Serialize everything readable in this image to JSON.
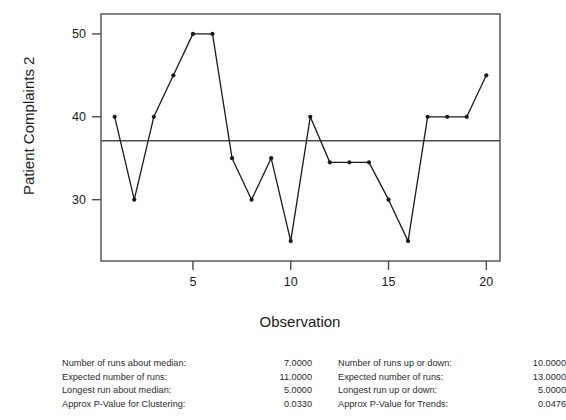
{
  "chart_data": {
    "type": "line",
    "title": "",
    "subtitle": "",
    "xlabel": "Observation",
    "ylabel": "Patient Complaints 2",
    "x": [
      1,
      2,
      3,
      4,
      5,
      6,
      7,
      8,
      9,
      10,
      11,
      12,
      13,
      14,
      15,
      16,
      17,
      18,
      19,
      20
    ],
    "values": [
      40,
      30,
      40,
      45,
      50,
      50,
      35,
      30,
      35,
      25,
      40,
      34.5,
      34.5,
      34.5,
      30,
      25,
      40,
      40,
      40,
      45
    ],
    "series": [
      {
        "name": "Patient Complaints 2",
        "values": [
          40,
          30,
          40,
          45,
          50,
          50,
          35,
          30,
          35,
          25,
          40,
          34.5,
          34.5,
          34.5,
          30,
          25,
          40,
          40,
          40,
          45
        ]
      }
    ],
    "reference_lines": [
      {
        "name": "median",
        "value": 37.1,
        "orientation": "horizontal"
      }
    ],
    "xlim": [
      0.3,
      20.7
    ],
    "ylim": [
      22.6,
      52.4
    ],
    "xticks": [
      5,
      10,
      15,
      20
    ],
    "xtick_labels": [
      "5",
      "10",
      "15",
      "20"
    ],
    "yticks": [
      30,
      40,
      50
    ],
    "ytick_labels": [
      "30",
      "40",
      "50"
    ],
    "grid": false,
    "legend": "none",
    "marker": "filled-circle",
    "line_color": "#1a1a1a",
    "median_line_color": "#4d4d4d",
    "frame_color": "#4d4d4d",
    "background_color": "#ffffff"
  },
  "stats": {
    "left": {
      "rows": [
        {
          "label": "Number of runs about median:",
          "value": "7.0000"
        },
        {
          "label": "Expected number of runs:",
          "value": "11.0000"
        },
        {
          "label": "Longest run about median:",
          "value": "5.0000"
        },
        {
          "label": "Approx P-Value for Clustering:",
          "value": "0.0330"
        }
      ]
    },
    "right": {
      "rows": [
        {
          "label": "Number of runs up or down:",
          "value": "10.0000"
        },
        {
          "label": "Expected number of runs:",
          "value": "13.0000"
        },
        {
          "label": "Longest run up or down:",
          "value": "5.0000"
        },
        {
          "label": "Approx P-Value for Trends:",
          "value": "0.0476"
        }
      ]
    }
  }
}
